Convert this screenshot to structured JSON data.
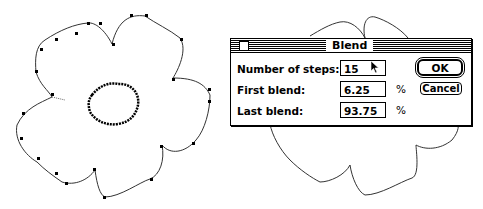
{
  "dialog": {
    "title": "Blend",
    "fields": [
      {
        "label": "Number of steps:",
        "value": "15",
        "unit": ""
      },
      {
        "label": "First blend:",
        "value": "6.25",
        "unit": "%"
      },
      {
        "label": "Last blend:",
        "value": "93.75",
        "unit": "%"
      }
    ],
    "ok_label": "OK",
    "cancel_label": "Cancel"
  },
  "artwork": {
    "left_shape": "flower outline with inner jagged ring, anchor points shown",
    "right_shape": "flower outline partially covered by dialog"
  }
}
